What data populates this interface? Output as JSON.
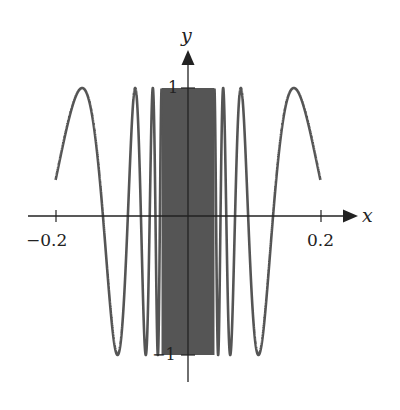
{
  "chart_data": {
    "type": "line",
    "title": "",
    "function": "y = sin(1/|x| + 1.6) (even, rapidly oscillating near 0)",
    "xlabel": "x",
    "ylabel": "y",
    "x_ticks": [
      {
        "value": -0.2,
        "label": "−0.2"
      },
      {
        "value": 0.2,
        "label": "0.2"
      }
    ],
    "y_ticks": [
      {
        "value": 1,
        "label": "1"
      },
      {
        "value": -1,
        "label": "−1"
      }
    ],
    "xlim": [
      -0.2,
      0.2
    ],
    "ylim": [
      -1,
      1
    ],
    "grid": false,
    "legend": null,
    "series": [
      {
        "name": "curve",
        "color": "#555555",
        "samples": [
          {
            "x": -0.2,
            "y": 0.26
          },
          {
            "x": -0.158,
            "y": 1
          },
          {
            "x": -0.129,
            "y": 0
          },
          {
            "x": -0.089,
            "y": 0
          },
          {
            "x": 0.089,
            "y": 0
          },
          {
            "x": 0.129,
            "y": 0
          },
          {
            "x": 0.158,
            "y": 1
          },
          {
            "x": 0.2,
            "y": 0.26
          }
        ]
      }
    ],
    "dense_band": {
      "x_from": -0.04,
      "x_to": 0.04,
      "y_from": -1,
      "y_to": 1,
      "color": "#555555"
    }
  },
  "axes": {
    "x_label": "x",
    "y_label": "y",
    "x_tick_neg": "−0.2",
    "x_tick_pos": "0.2",
    "y_tick_top": "1",
    "y_tick_bottom": "−1"
  },
  "colors": {
    "curve": "#555555",
    "axis": "#222222"
  }
}
